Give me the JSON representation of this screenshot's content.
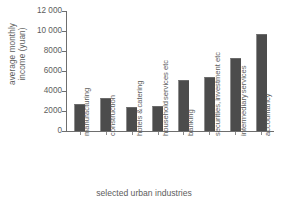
{
  "chart_data": {
    "type": "bar",
    "title": "",
    "subtitle": "",
    "xlabel": "selected urban industries",
    "ylabel": "average monthly income (yuan)",
    "ylabel_lines": [
      "average monthly",
      "income (yuan)"
    ],
    "categories": [
      "manufacturing",
      "construction",
      "hotels & catering",
      "household services etc",
      "banking",
      "securities, investment etc",
      "intermediary services",
      "accountancy"
    ],
    "category_label_lines": [
      [
        "manufacturing"
      ],
      [
        "construction"
      ],
      [
        "hotels &",
        "catering"
      ],
      [
        "household",
        "services etc"
      ],
      [
        "banking"
      ],
      [
        "securities,",
        "investment etc"
      ],
      [
        "intermediary",
        "services"
      ],
      [
        "accountancy"
      ]
    ],
    "values": [
      2700,
      3300,
      2450,
      2550,
      5150,
      5400,
      7300,
      9700
    ],
    "ylim": [
      0,
      12000
    ],
    "yticks": [
      0,
      2000,
      4000,
      6000,
      8000,
      10000,
      12000
    ],
    "ytick_labels": [
      "0",
      "2000",
      "4000",
      "6000",
      "8000",
      "10 000",
      "12 000"
    ],
    "grid": false,
    "legend": false,
    "legend_position": "none",
    "bar_color": "#4c4c4c",
    "axis_color": "#6e6e6e",
    "text_color": "#5d5d5d",
    "background_color": "#ffffff",
    "orientation": "vertical",
    "category_label_rotation": 90
  }
}
